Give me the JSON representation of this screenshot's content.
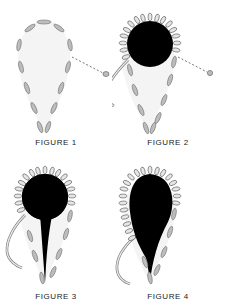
{
  "colors": {
    "fill_black": "#000000",
    "stitch_grey": "#bdbdbd",
    "stitch_outline": "#6e6e6e",
    "background": "#ffffff",
    "teardrop_fill": "#f4f4f4"
  },
  "figures": [
    {
      "id": 1,
      "caption": "FIGURE 1"
    },
    {
      "id": 2,
      "caption": "FIGURE 2"
    },
    {
      "id": 3,
      "caption": "FIGURE 3"
    },
    {
      "id": 4,
      "caption": "FIGURE 4"
    }
  ]
}
